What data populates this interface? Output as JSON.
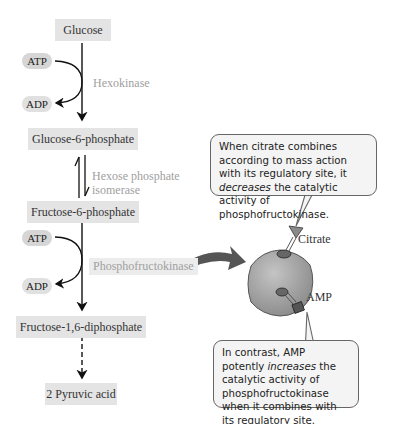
{
  "pathway": {
    "glucose": "Glucose",
    "g6p": "Glucose-6-phosphate",
    "f6p": "Fructose-6-phosphate",
    "f16dp": "Fructose-1,6-diphosphate",
    "pyruvic": "2 Pyruvic acid"
  },
  "enzymes": {
    "hexokinase": "Hexokinase",
    "isomerase_line1": "Hexose phosphate",
    "isomerase_line2": "isomerase",
    "pfk": "Phosphofructokinase"
  },
  "cofactors": {
    "atp1": "ATP",
    "adp1": "ADP",
    "atp2": "ATP",
    "adp2": "ADP"
  },
  "regulators": {
    "citrate": "Citrate",
    "amp": "AMP"
  },
  "callouts": {
    "citrate": {
      "pre": "When citrate combines according to mass action with its regulatory site, it ",
      "em": "decreases",
      "post": " the catalytic activity of phosphofructokinase."
    },
    "amp": {
      "pre": "In contrast, AMP potently ",
      "em": "increases",
      "post": " the catalytic activity of phosphofructokinase when it combines with its regulatory site."
    }
  },
  "colors": {
    "box_bg": "#e4e4e4",
    "enzyme_text": "#a0a0a0",
    "sphere": "#9a9a9a",
    "curved_arrow": "#555555"
  }
}
